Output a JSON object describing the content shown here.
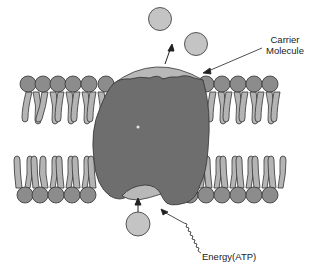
{
  "diagram": {
    "labels": {
      "carrier_line1": "Carrier",
      "carrier_line2": "Molecule",
      "energy": "Energy(ATP)"
    },
    "colors": {
      "background": "#ffffff",
      "phospholipid_head": "#8c8c8c",
      "phospholipid_tail": "#b4b4b4",
      "carrier_protein": "#6e6e6e",
      "carrier_cap": "#b8b8b8",
      "molecule": "#c4c4c4",
      "outline": "#333333"
    },
    "elements": {
      "molecules_outside": 2,
      "molecules_inside": 1,
      "top_head_count": 11,
      "bottom_head_count": 11
    }
  }
}
